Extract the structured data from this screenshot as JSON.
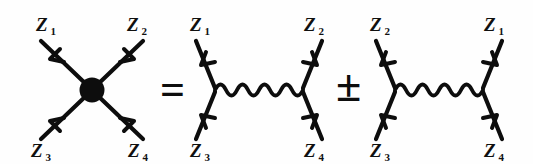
{
  "figure": {
    "kind": "feynman-diagram-equation",
    "background_color": "#fefefe",
    "ink_color": "#0d0d0d",
    "width": 533,
    "height": 164
  },
  "operators": {
    "equals": "=",
    "plus_minus": "±"
  },
  "diagrams": [
    {
      "id": "contact-blob",
      "type": "contact-vertex",
      "has_blob": true,
      "has_wavy_propagator": false,
      "labels": {
        "top_left": {
          "symbol": "Z",
          "sub": "1"
        },
        "top_right": {
          "symbol": "Z",
          "sub": "2"
        },
        "bottom_left": {
          "symbol": "Z",
          "sub": "3"
        },
        "bottom_right": {
          "symbol": "Z",
          "sub": "4"
        }
      }
    },
    {
      "id": "t-channel",
      "type": "exchange-diagram",
      "has_blob": false,
      "has_wavy_propagator": true,
      "labels": {
        "top_left": {
          "symbol": "Z",
          "sub": "1"
        },
        "top_right": {
          "symbol": "Z",
          "sub": "2"
        },
        "bottom_left": {
          "symbol": "Z",
          "sub": "3"
        },
        "bottom_right": {
          "symbol": "Z",
          "sub": "4"
        }
      }
    },
    {
      "id": "u-channel",
      "type": "exchange-diagram",
      "has_blob": false,
      "has_wavy_propagator": true,
      "labels": {
        "top_left": {
          "symbol": "Z",
          "sub": "2"
        },
        "top_right": {
          "symbol": "Z",
          "sub": "1"
        },
        "bottom_left": {
          "symbol": "Z",
          "sub": "3"
        },
        "bottom_right": {
          "symbol": "Z",
          "sub": "4"
        }
      }
    }
  ]
}
